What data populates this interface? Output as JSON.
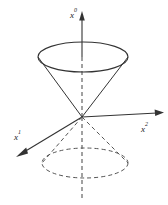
{
  "figure": {
    "name": "light-cone-diagram",
    "background_color": "#ffffff",
    "line_color": "#333333",
    "dashed_color": "#555555"
  },
  "axes": [
    {
      "id": "x0",
      "base": "x",
      "exponent": "0",
      "label": "x⁰",
      "direction": "up",
      "style": "solid-then-dashed",
      "label_x": 72,
      "label_y": 17
    },
    {
      "id": "x1",
      "base": "x",
      "exponent": "1",
      "label": "x¹",
      "direction": "lower-left",
      "style": "solid",
      "label_x": 16,
      "label_y": 139
    },
    {
      "id": "x2",
      "base": "x",
      "exponent": "2",
      "label": "x²",
      "direction": "right",
      "style": "solid",
      "label_x": 142,
      "label_y": 131
    }
  ],
  "geometry": {
    "origin": {
      "x": 82,
      "y": 117
    },
    "upper_cone": {
      "rim_center": {
        "x": 83,
        "y": 57
      },
      "rim_rx": 45,
      "rim_ry": 15,
      "stroke": "solid"
    },
    "lower_cone": {
      "rim_center": {
        "x": 85,
        "y": 163
      },
      "rim_rx": 43,
      "rim_ry": 15,
      "stroke": "dashed"
    }
  }
}
